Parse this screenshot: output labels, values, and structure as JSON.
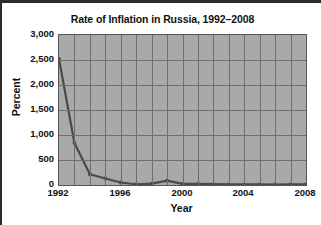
{
  "chart_data": {
    "type": "line",
    "title": "Rate of Inflation in Russia, 1992–2008",
    "xlabel": "Year",
    "ylabel": "Percent",
    "x": [
      1992,
      1993,
      1994,
      1995,
      1996,
      1997,
      1998,
      1999,
      2000,
      2001,
      2002,
      2003,
      2004,
      2005,
      2006,
      2007,
      2008
    ],
    "values": [
      2520,
      840,
      215,
      130,
      50,
      15,
      28,
      86,
      21,
      22,
      16,
      14,
      11,
      13,
      10,
      12,
      14
    ],
    "xlim": [
      1992,
      2008
    ],
    "ylim": [
      0,
      3000
    ],
    "xticks": [
      1992,
      1996,
      2000,
      2004,
      2008
    ],
    "xtick_labels": [
      "1992",
      "1996",
      "2000",
      "2004",
      "2008"
    ],
    "yticks": [
      0,
      500,
      1000,
      1500,
      2000,
      2500,
      3000
    ],
    "ytick_labels": [
      "0",
      "500",
      "1,000",
      "1,500",
      "2,000",
      "2,500",
      "3,000"
    ],
    "grid": true,
    "legend": null,
    "series_color": "#4a4a4a",
    "plot_background": "#a9a9a9",
    "gridline_color": "#6f6f6f",
    "marker": "circle"
  }
}
